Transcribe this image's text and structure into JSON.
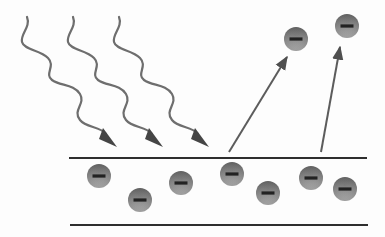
{
  "diagram": {
    "colors": {
      "background": "#fdfdfd",
      "wave": "#6e6e6e",
      "arrowhead": "#4a4a4a",
      "surface_line": "#2e2e2e",
      "ejection_arrow": "#5c5c5c",
      "electron_top": "#5e5e5e",
      "electron_bottom": "#b4b4b4",
      "minus_sign": "#222222"
    },
    "surface": {
      "top_line": {
        "x1": 69,
        "x2": 367,
        "y": 158
      },
      "bottom_line": {
        "x1": 70,
        "x2": 368,
        "y": 225
      }
    },
    "incoming_light_waves": [
      {
        "offset_x": 0,
        "tip": [
          117,
          147
        ]
      },
      {
        "offset_x": 46,
        "tip": [
          163,
          147
        ]
      },
      {
        "offset_x": 92,
        "tip": [
          209,
          147
        ]
      }
    ],
    "ejection_arrows": [
      {
        "from": [
          229,
          152
        ],
        "to": [
          287,
          57
        ]
      },
      {
        "from": [
          321,
          152
        ],
        "to": [
          340,
          47
        ]
      }
    ],
    "electrons_in_metal": [
      {
        "cx": 99,
        "cy": 176,
        "symbol": "−"
      },
      {
        "cx": 140,
        "cy": 200,
        "symbol": "−"
      },
      {
        "cx": 181,
        "cy": 183,
        "symbol": "−"
      },
      {
        "cx": 232,
        "cy": 174,
        "symbol": "−"
      },
      {
        "cx": 268,
        "cy": 193,
        "symbol": "−"
      },
      {
        "cx": 311,
        "cy": 178,
        "symbol": "−"
      },
      {
        "cx": 345,
        "cy": 189,
        "symbol": "−"
      }
    ],
    "ejected_electrons": [
      {
        "cx": 296,
        "cy": 39,
        "symbol": "−"
      },
      {
        "cx": 347,
        "cy": 26,
        "symbol": "−"
      }
    ],
    "electron_radius": 12
  }
}
